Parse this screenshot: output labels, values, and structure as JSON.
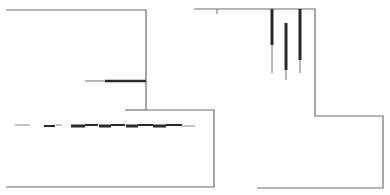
{
  "diagram": {
    "width": 390,
    "height": 195,
    "background": "#ffffff",
    "outline_color": "#6e6e6e",
    "mark_color": "#2a2a2a",
    "left_panel": {
      "outline": [
        [
          6,
          10
        ],
        [
          146,
          10
        ],
        [
          146,
          110
        ],
        [
          214,
          110
        ],
        [
          214,
          187
        ],
        [
          6,
          187
        ]
      ],
      "bottom_edge": [
        [
          6,
          187
        ],
        [
          214,
          187
        ]
      ]
    },
    "right_panel": {
      "outline": [
        [
          194,
          9
        ],
        [
          315,
          9
        ],
        [
          315,
          116
        ],
        [
          383,
          116
        ],
        [
          383,
          188
        ],
        [
          257,
          188
        ]
      ],
      "tick": [
        [
          217,
          9
        ],
        [
          217,
          14
        ]
      ]
    },
    "horizontal_traces": [
      {
        "name": "upper-trace",
        "y": 81,
        "x1": 85,
        "x2": 146,
        "thick_from": 105,
        "thick_to": 146
      },
      {
        "name": "short-ledge",
        "y": 110,
        "x1": 125,
        "x2": 146,
        "thick_from": null,
        "thick_to": null
      }
    ],
    "dashed_band": {
      "y": 125,
      "segments": [
        {
          "x1": 15,
          "x2": 30,
          "w": 1
        },
        {
          "x1": 44,
          "x2": 55,
          "w": 2
        },
        {
          "x1": 56,
          "x2": 62,
          "w": 1
        },
        {
          "x1": 71,
          "x2": 85,
          "w": 3
        },
        {
          "x1": 85,
          "x2": 98,
          "w": 2
        },
        {
          "x1": 99,
          "x2": 111,
          "w": 3
        },
        {
          "x1": 111,
          "x2": 125,
          "w": 2
        },
        {
          "x1": 126,
          "x2": 138,
          "w": 3
        },
        {
          "x1": 138,
          "x2": 153,
          "w": 2
        },
        {
          "x1": 153,
          "x2": 166,
          "w": 3
        },
        {
          "x1": 166,
          "x2": 182,
          "w": 2
        },
        {
          "x1": 182,
          "x2": 195,
          "w": 1
        }
      ]
    },
    "vertical_traces": [
      {
        "name": "vertical-trace-1",
        "x": 272,
        "y1": 9,
        "y2": 73,
        "thick_to": 45
      },
      {
        "name": "vertical-trace-2",
        "x": 286,
        "y1": 23,
        "y2": 80,
        "thick_to": 70
      },
      {
        "name": "vertical-trace-3",
        "x": 300,
        "y1": 9,
        "y2": 73,
        "thick_to": 60
      }
    ]
  }
}
